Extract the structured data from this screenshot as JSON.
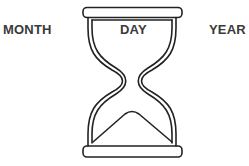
{
  "labels": {
    "left": "MONTH",
    "center": "DAY",
    "right": "YEAR"
  },
  "graphic": {
    "icon": "hourglass-icon",
    "stroke_color": "#222222"
  }
}
